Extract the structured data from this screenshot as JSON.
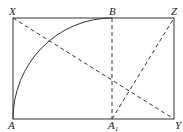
{
  "diagram": {
    "title": "",
    "colors": {
      "stroke": "#333333",
      "background": "#ffffff"
    },
    "points": {
      "X": {
        "label": "X",
        "x": 13,
        "y": 18
      },
      "B": {
        "label": "B",
        "x": 112,
        "y": 18
      },
      "Z": {
        "label": "Z",
        "x": 174,
        "y": 18
      },
      "A": {
        "label": "A",
        "x": 13,
        "y": 119
      },
      "A1": {
        "label": "A",
        "sub": "1",
        "x": 112,
        "y": 119
      },
      "Y": {
        "label": "Y",
        "x": 174,
        "y": 119
      }
    },
    "solid_lines": [
      [
        "X",
        "Z"
      ],
      [
        "Z",
        "Y"
      ],
      [
        "Y",
        "A"
      ],
      [
        "A",
        "X"
      ]
    ],
    "dashed_lines": [
      [
        "X",
        "Y"
      ],
      [
        "B",
        "A1"
      ],
      [
        "A1",
        "Z"
      ]
    ],
    "arcs": [
      {
        "from": "A",
        "to": "B",
        "center": "A1",
        "style": "solid"
      }
    ]
  }
}
